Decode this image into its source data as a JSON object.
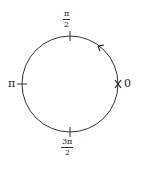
{
  "diagram": {
    "type": "unit-circle-angles",
    "circle": {
      "cx": 70,
      "cy": 84,
      "r": 48,
      "stroke": "#333333"
    },
    "labels": {
      "top": {
        "num": "π",
        "den": "2"
      },
      "left": {
        "text": "π"
      },
      "right": {
        "text": "0"
      },
      "bottom": {
        "num": "3π",
        "den": "2"
      }
    },
    "marks": {
      "start_point": "×",
      "direction": "counterclockwise"
    }
  }
}
